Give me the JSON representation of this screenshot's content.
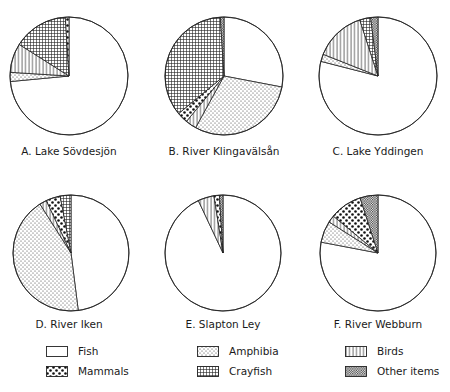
{
  "chart_data": [
    {
      "type": "pie",
      "title": "A. Lake Sövdesjön",
      "categories": [
        "Fish",
        "Amphibia",
        "Birds",
        "Crayfish",
        "Mammals"
      ],
      "values": [
        73.5,
        2.5,
        8,
        15,
        1
      ],
      "center": [
        69,
        76
      ],
      "radius": 59
    },
    {
      "type": "pie",
      "title": "B. River Klingavälsån",
      "categories": [
        "Fish",
        "Amphibia",
        "Birds",
        "Mammals",
        "Crayfish",
        "Other items"
      ],
      "values": [
        28,
        30,
        3,
        3,
        35,
        1
      ],
      "center": [
        224,
        76
      ],
      "radius": 59
    },
    {
      "type": "pie",
      "title": "C. Lake Yddingen",
      "categories": [
        "Fish",
        "Amphibia",
        "Birds",
        "Crayfish",
        "Other items"
      ],
      "values": [
        79,
        2,
        14,
        3,
        2
      ],
      "center": [
        378,
        76
      ],
      "radius": 59
    },
    {
      "type": "pie",
      "title": "D. River Iken",
      "categories": [
        "Fish",
        "Amphibia",
        "Birds",
        "Mammals",
        "Crayfish"
      ],
      "values": [
        48,
        43,
        2,
        4,
        3
      ],
      "center": [
        71,
        253
      ],
      "radius": 58
    },
    {
      "type": "pie",
      "title": "E. Slapton Ley",
      "categories": [
        "Fish",
        "Birds",
        "Mammals",
        "Other items"
      ],
      "values": [
        93,
        4.5,
        1.5,
        1
      ],
      "center": [
        223,
        253
      ],
      "radius": 58
    },
    {
      "type": "pie",
      "title": "F. River Webburn",
      "categories": [
        "Fish",
        "Amphibia",
        "Birds",
        "Mammals",
        "Other items"
      ],
      "values": [
        78,
        6,
        2,
        9,
        5
      ],
      "center": [
        378,
        253
      ],
      "radius": 58
    }
  ],
  "legend": {
    "items": [
      {
        "label": "Fish",
        "pattern": "fish"
      },
      {
        "label": "Amphibia",
        "pattern": "amphibia"
      },
      {
        "label": "Birds",
        "pattern": "birds"
      },
      {
        "label": "Mammals",
        "pattern": "mammals"
      },
      {
        "label": "Crayfish",
        "pattern": "crayfish"
      },
      {
        "label": "Other items",
        "pattern": "other"
      }
    ]
  },
  "colors": {
    "stroke": "#222222",
    "background": "#ffffff"
  }
}
